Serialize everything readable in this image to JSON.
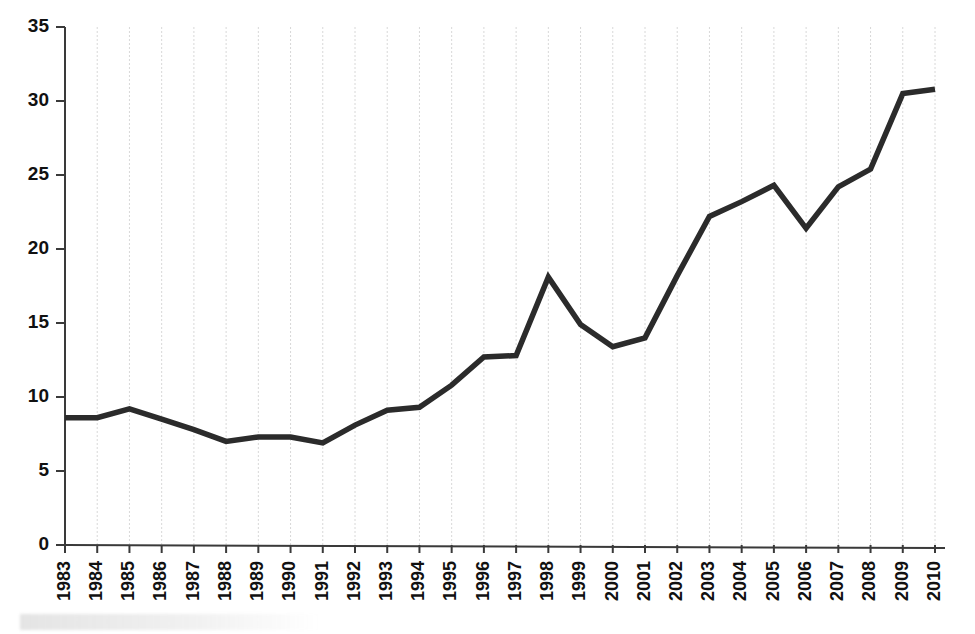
{
  "chart_data": {
    "type": "line",
    "title": "",
    "xlabel": "",
    "ylabel": "",
    "grid": "vertical-dashed",
    "legend": "none",
    "ylim": [
      0,
      35
    ],
    "yticks": [
      0,
      5,
      10,
      15,
      20,
      25,
      30,
      35
    ],
    "categories": [
      "1983",
      "1984",
      "1985",
      "1986",
      "1987",
      "1988",
      "1989",
      "1990",
      "1991",
      "1992",
      "1993",
      "1994",
      "1995",
      "1996",
      "1997",
      "1998",
      "1999",
      "2000",
      "2001",
      "2002",
      "2003",
      "2004",
      "2005",
      "2006",
      "2007",
      "2008",
      "2009",
      "2010"
    ],
    "values": [
      8.6,
      8.6,
      9.2,
      8.5,
      7.8,
      7.0,
      7.3,
      7.3,
      6.9,
      8.1,
      9.1,
      9.3,
      10.8,
      12.7,
      12.8,
      18.1,
      14.9,
      13.4,
      14.0,
      18.2,
      22.2,
      23.2,
      24.3,
      21.4,
      24.2,
      25.4,
      30.5,
      30.8
    ],
    "series_name": "value",
    "line_color": "#2b2b2b",
    "grid_color": "#d8d8d8",
    "axis_color": "#3a3a3a"
  }
}
